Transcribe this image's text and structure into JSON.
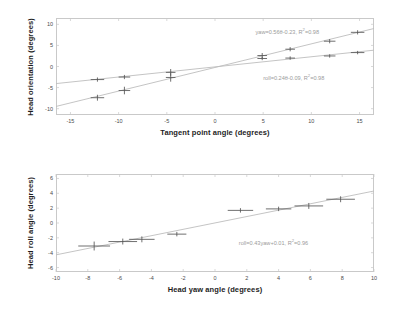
{
  "figure": {
    "title": "",
    "panels": [
      "head-orientation-vs-tangent-point-angle",
      "head-roll-vs-head-yaw"
    ]
  },
  "chart_data": [
    {
      "id": "top",
      "type": "scatter",
      "title": "",
      "xlabel": "Tangent point angle (degrees)",
      "ylabel": "Head orientation (degrees)",
      "xlim": [
        -16.5,
        16.5
      ],
      "ylim": [
        -11.5,
        11.5
      ],
      "xticks": [
        -15,
        -10,
        -5,
        0,
        5,
        10,
        15
      ],
      "xticklabels": [
        "-15",
        "-10",
        "-5",
        "0",
        "5",
        "10",
        "15"
      ],
      "yticks": [
        -10,
        -5,
        0,
        5,
        10
      ],
      "yticklabels": [
        "-10",
        "-5",
        "0",
        "5",
        "10"
      ],
      "grid": false,
      "legend": "none",
      "annotations": [
        {
          "name": "yaw-fit-equation",
          "text": "yaw=0.56θ-0.23, R",
          "sup": "2",
          "tail": "=0.98",
          "x": 4.2,
          "y": 8.3
        },
        {
          "name": "roll-fit-equation",
          "text": "roll=0.24θ-0.09, R",
          "sup": "2",
          "tail": "=0.98",
          "x": 5.0,
          "y": -2.6
        }
      ],
      "series": [
        {
          "name": "yaw",
          "marker": "plus-errorbar",
          "color": "#555555",
          "x": [
            -12.2,
            -9.4,
            -4.6,
            4.9,
            7.8,
            11.9,
            14.8
          ],
          "y": [
            -7.4,
            -5.7,
            -2.6,
            2.6,
            4.1,
            6.0,
            8.1
          ],
          "xerr": [
            0.7,
            0.6,
            0.5,
            0.5,
            0.5,
            0.6,
            0.7
          ],
          "yerr": [
            0.7,
            0.9,
            1.0,
            0.6,
            0.5,
            0.5,
            0.5
          ],
          "fit": {
            "slope": 0.56,
            "intercept": -0.23,
            "r2": 0.98,
            "color": "#bdbdbd"
          }
        },
        {
          "name": "roll",
          "marker": "plus-errorbar",
          "color": "#555555",
          "x": [
            -12.2,
            -9.4,
            -4.6,
            4.9,
            7.8,
            11.9,
            14.8
          ],
          "y": [
            -3.1,
            -2.5,
            -1.4,
            1.9,
            2.0,
            2.5,
            3.3
          ],
          "xerr": [
            0.7,
            0.6,
            0.5,
            0.5,
            0.5,
            0.6,
            0.7
          ],
          "yerr": [
            0.5,
            0.5,
            0.8,
            0.4,
            0.4,
            0.4,
            0.4
          ],
          "fit": {
            "slope": 0.24,
            "intercept": -0.09,
            "r2": 0.98,
            "color": "#bdbdbd"
          }
        }
      ]
    },
    {
      "id": "bottom",
      "type": "scatter",
      "title": "",
      "xlabel": "Head yaw angle (degrees)",
      "ylabel": "Head roll angle (degrees)",
      "xlim": [
        -10,
        10
      ],
      "ylim": [
        -6.6,
        6.6
      ],
      "xticks": [
        -10,
        -8,
        -6,
        -4,
        -2,
        0,
        2,
        4,
        6,
        8,
        10
      ],
      "xticklabels": [
        "-10",
        "-8",
        "-6",
        "-4",
        "-2",
        "0",
        "2",
        "4",
        "6",
        "8",
        "10"
      ],
      "yticks": [
        -6,
        -4,
        -2,
        0,
        2,
        4,
        6
      ],
      "yticklabels": [
        "-6",
        "-4",
        "-2",
        "0",
        "2",
        "4",
        "6"
      ],
      "grid": false,
      "legend": "none",
      "annotations": [
        {
          "name": "roll-yaw-fit-equation",
          "text": "roll=0.43yaw+0.01, R",
          "sup": "2",
          "tail": "=0.96",
          "x": 1.5,
          "y": -2.5
        }
      ],
      "series": [
        {
          "name": "roll-vs-yaw",
          "marker": "plus-errorbar",
          "color": "#555555",
          "x": [
            -7.6,
            -5.8,
            -4.6,
            -2.4,
            1.6,
            4.0,
            5.9,
            7.9
          ],
          "y": [
            -3.1,
            -2.5,
            -2.2,
            -1.5,
            1.7,
            1.9,
            2.3,
            3.2
          ],
          "xerr": [
            1.0,
            0.9,
            0.8,
            0.6,
            0.8,
            0.8,
            0.9,
            0.9
          ],
          "yerr": [
            0.6,
            0.4,
            0.4,
            0.3,
            0.3,
            0.3,
            0.4,
            0.4
          ],
          "fit": {
            "slope": 0.43,
            "intercept": 0.01,
            "r2": 0.96,
            "color": "#bdbdbd"
          }
        }
      ]
    }
  ]
}
